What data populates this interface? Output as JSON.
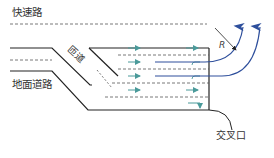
{
  "diagram": {
    "labels": {
      "expressway": "快速路",
      "ground_road": "地面道路",
      "ramp": "匝道",
      "intersection": "交叉口",
      "radius": "R"
    },
    "colors": {
      "road_edge": "#222222",
      "lane_dash": "#555555",
      "lane_arrow": "#4a9a9a",
      "turn_arrow": "#2e4f9c",
      "background": "#ffffff"
    }
  }
}
